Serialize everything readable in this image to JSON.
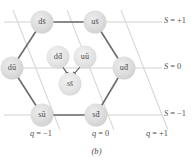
{
  "figure": {
    "caption": "(b)",
    "nodes": [
      {
        "id": "ds",
        "label": "ds̄",
        "x": 42,
        "y": 22,
        "r": 11.5,
        "type": "vertex"
      },
      {
        "id": "us",
        "label": "us̄",
        "x": 95,
        "y": 22,
        "r": 11.5,
        "type": "vertex"
      },
      {
        "id": "ud",
        "label": "ud̄",
        "x": 124,
        "y": 68,
        "r": 11.5,
        "type": "vertex"
      },
      {
        "id": "sd",
        "label": "sd̄",
        "x": 96,
        "y": 115,
        "r": 11.5,
        "type": "vertex"
      },
      {
        "id": "su",
        "label": "sū",
        "x": 42,
        "y": 115,
        "r": 11.5,
        "type": "vertex"
      },
      {
        "id": "du",
        "label": "dū",
        "x": 12,
        "y": 68,
        "r": 11.5,
        "type": "vertex"
      },
      {
        "id": "dd",
        "label": "dd̄",
        "x": 58,
        "y": 57,
        "r": 11.5,
        "type": "center"
      },
      {
        "id": "uu",
        "label": "uū",
        "x": 85,
        "y": 57,
        "r": 11.5,
        "type": "center"
      },
      {
        "id": "ss",
        "label": "ss̄",
        "x": 70,
        "y": 84,
        "r": 11.5,
        "type": "center"
      }
    ],
    "strangeness_lines": [
      {
        "id": "s-plus-1",
        "label_symbol": "S",
        "label_value": "= +1",
        "y": 22
      },
      {
        "id": "s-zero",
        "label_symbol": "S",
        "label_value": "= 0",
        "y": 68
      },
      {
        "id": "s-minus-1",
        "label_symbol": "S",
        "label_value": "= −1",
        "y": 115
      }
    ],
    "charge_lines": [
      {
        "id": "q-minus-1",
        "label_symbol": "q",
        "label_value": "= −1",
        "x": 46
      },
      {
        "id": "q-zero",
        "label_symbol": "q",
        "label_value": "= 0",
        "x": 104
      },
      {
        "id": "q-plus-1",
        "label_symbol": "q",
        "label_value": "= +1",
        "x": 158
      }
    ],
    "colors": {
      "background": "#ffffff",
      "node_fill": "#d9d9d9",
      "node_fill_light": "#e6e6e6",
      "hexagon_stroke": "#6f6f6f",
      "axis_stroke": "#cccccc",
      "text": "#4a4a4a"
    }
  }
}
